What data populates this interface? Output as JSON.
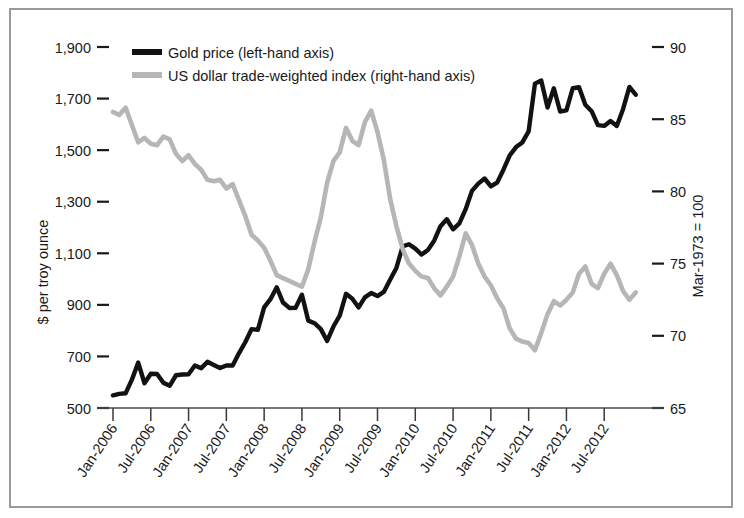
{
  "chart_data": {
    "type": "line",
    "title": "",
    "xlabel": "",
    "ylabel": "$ per troy ounce",
    "y2label": "Mar-1973 = 100",
    "grid": false,
    "legend_position": "top-left",
    "ylim": [
      500,
      1900
    ],
    "y2lim": [
      65,
      90
    ],
    "yticks": [
      "500",
      "700",
      "900",
      "1,100",
      "1,300",
      "1,500",
      "1,700",
      "1,900"
    ],
    "ytick_values": [
      500,
      700,
      900,
      1100,
      1300,
      1500,
      1700,
      1900
    ],
    "y2ticks": [
      "65",
      "70",
      "75",
      "80",
      "85",
      "90"
    ],
    "y2tick_values": [
      65,
      70,
      75,
      80,
      85,
      90
    ],
    "xticks": [
      "Jan-2006",
      "Jul-2006",
      "Jan-2007",
      "Jul-2007",
      "Jan-2008",
      "Jul-2008",
      "Jan-2009",
      "Jul-2009",
      "Jan-2010",
      "Jul-2010",
      "Jan-2011",
      "Jul-2011",
      "Jan-2012",
      "Jul-2012"
    ],
    "x_start": "Jan-2006",
    "x_end": "Oct-2012",
    "x_interval": "monthly",
    "n_points": 82,
    "series": [
      {
        "name": "Gold price (left-hand axis)",
        "axis": "left",
        "color": "#121212",
        "values": [
          549,
          555,
          557,
          610,
          676,
          596,
          633,
          632,
          598,
          586,
          627,
          630,
          631,
          665,
          654,
          679,
          667,
          655,
          665,
          665,
          712,
          755,
          806,
          803,
          890,
          922,
          968,
          909,
          888,
          889,
          939,
          839,
          829,
          806,
          760,
          816,
          858,
          943,
          924,
          890,
          929,
          946,
          934,
          950,
          997,
          1043,
          1127,
          1135,
          1118,
          1095,
          1113,
          1149,
          1205,
          1232,
          1193,
          1216,
          1271,
          1342,
          1370,
          1390,
          1360,
          1374,
          1424,
          1480,
          1512,
          1530,
          1573,
          1758,
          1770,
          1665,
          1740,
          1650,
          1654,
          1740,
          1744,
          1676,
          1651,
          1597,
          1594,
          1613,
          1594,
          1660,
          1745,
          1715
        ]
      },
      {
        "name": "US dollar trade-weighted index (right-hand axis)",
        "axis": "right",
        "color": "#b6b6b6",
        "values": [
          85.5,
          85.3,
          85.8,
          84.6,
          83.4,
          83.7,
          83.3,
          83.2,
          83.8,
          83.6,
          82.6,
          82.1,
          82.5,
          81.9,
          81.5,
          80.8,
          80.7,
          80.8,
          80.2,
          80.5,
          79.4,
          78.3,
          77.0,
          76.6,
          76.1,
          75.2,
          74.2,
          74.0,
          73.8,
          73.6,
          73.4,
          74.6,
          76.5,
          78.2,
          80.6,
          82.1,
          82.7,
          84.4,
          83.5,
          83.2,
          84.8,
          85.6,
          84.1,
          82.2,
          79.5,
          77.6,
          76.0,
          75.0,
          74.5,
          74.1,
          74.0,
          73.3,
          72.8,
          73.4,
          74.1,
          75.5,
          77.1,
          76.3,
          75.0,
          74.1,
          73.5,
          72.6,
          71.9,
          70.5,
          69.8,
          69.6,
          69.5,
          69.0,
          70.2,
          71.5,
          72.4,
          72.1,
          72.5,
          73.0,
          74.3,
          74.8,
          73.6,
          73.3,
          74.3,
          75.0,
          74.2,
          73.1,
          72.5,
          73.0
        ]
      }
    ],
    "annotations": []
  },
  "legend": {
    "items": [
      {
        "label": "Gold price (left-hand axis)",
        "color": "#121212"
      },
      {
        "label": "US dollar trade-weighted index (right-hand axis)",
        "color": "#b6b6b6"
      }
    ]
  },
  "axes": {
    "left_title": "$ per troy ounce",
    "right_title": "Mar-1973 = 100"
  }
}
